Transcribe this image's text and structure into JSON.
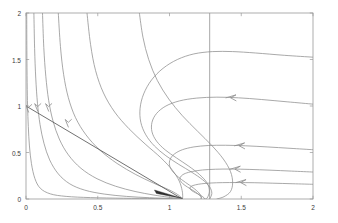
{
  "chart_data": {
    "type": "line",
    "title": "",
    "subtitle": "",
    "xlabel": "",
    "ylabel": "",
    "xlim": [
      0,
      2
    ],
    "ylim": [
      0,
      2
    ],
    "grid": false,
    "legend": "none",
    "xticks": [
      "0",
      "0.5",
      "1",
      "1.5",
      "2"
    ],
    "xtick_values": [
      0,
      0.5,
      1,
      1.5,
      2
    ],
    "yticks": [
      "0",
      "0.5",
      "1",
      "1.5",
      "2"
    ],
    "ytick_values": [
      0,
      0.5,
      1,
      1.5,
      2
    ],
    "equilibrium_point": [
      1.09,
      0.0
    ],
    "colors": {
      "trajectory": "#8c8c8c",
      "nullcline": "#4d4d4d",
      "axis": "#9a9a9a",
      "vertical_line": "#8c8c8c",
      "arrow": "#8c8c8c",
      "background": "#ffffff"
    },
    "vertical_line": {
      "x": 1.28,
      "y_from": 0.0,
      "y_to": 2.0
    },
    "straight_line": {
      "x_from": 0.0,
      "y_from": 1.0,
      "x_to": 1.09,
      "y_to": 0.0
    },
    "series": [
      {
        "name": "trajectory-1",
        "points": [
          [
            0.005,
            2.0
          ],
          [
            0.006,
            1.6
          ],
          [
            0.008,
            1.25
          ],
          [
            0.011,
            1.0
          ],
          [
            0.016,
            0.78
          ],
          [
            0.024,
            0.57
          ],
          [
            0.038,
            0.38
          ],
          [
            0.062,
            0.22
          ],
          [
            0.1,
            0.115
          ],
          [
            0.17,
            0.055
          ],
          [
            0.28,
            0.028
          ],
          [
            0.45,
            0.015
          ],
          [
            0.68,
            0.008
          ],
          [
            0.9,
            0.005
          ],
          [
            1.09,
            0.0
          ]
        ],
        "arrow": {
          "x": 0.018,
          "y": 0.99,
          "dir": "down"
        }
      },
      {
        "name": "trajectory-2",
        "points": [
          [
            0.055,
            2.0
          ],
          [
            0.06,
            1.62
          ],
          [
            0.068,
            1.3
          ],
          [
            0.08,
            1.03
          ],
          [
            0.098,
            0.8
          ],
          [
            0.125,
            0.6
          ],
          [
            0.165,
            0.42
          ],
          [
            0.225,
            0.27
          ],
          [
            0.305,
            0.163
          ],
          [
            0.41,
            0.095
          ],
          [
            0.545,
            0.053
          ],
          [
            0.7,
            0.028
          ],
          [
            0.86,
            0.014
          ],
          [
            1.0,
            0.006
          ],
          [
            1.09,
            0.0
          ]
        ],
        "arrow": {
          "x": 0.082,
          "y": 1.0,
          "dir": "down"
        }
      },
      {
        "name": "trajectory-3",
        "points": [
          [
            0.115,
            2.0
          ],
          [
            0.124,
            1.63
          ],
          [
            0.138,
            1.32
          ],
          [
            0.158,
            1.06
          ],
          [
            0.188,
            0.84
          ],
          [
            0.232,
            0.645
          ],
          [
            0.295,
            0.475
          ],
          [
            0.383,
            0.33
          ],
          [
            0.495,
            0.218
          ],
          [
            0.625,
            0.137
          ],
          [
            0.76,
            0.081
          ],
          [
            0.885,
            0.044
          ],
          [
            0.99,
            0.02
          ],
          [
            1.055,
            0.007
          ],
          [
            1.09,
            0.0
          ]
        ],
        "arrow": {
          "x": 0.158,
          "y": 1.0,
          "dir": "down"
        }
      },
      {
        "name": "trajectory-4",
        "points": [
          [
            0.225,
            2.0
          ],
          [
            0.24,
            1.64
          ],
          [
            0.262,
            1.34
          ],
          [
            0.295,
            1.09
          ],
          [
            0.345,
            0.875
          ],
          [
            0.418,
            0.69
          ],
          [
            0.515,
            0.525
          ],
          [
            0.635,
            0.382
          ],
          [
            0.765,
            0.263
          ],
          [
            0.89,
            0.17
          ],
          [
            0.995,
            0.1
          ],
          [
            1.055,
            0.05
          ],
          [
            1.082,
            0.016
          ],
          [
            1.09,
            0.0
          ]
        ],
        "arrow": {
          "x": 0.295,
          "y": 0.83,
          "dir": "down"
        }
      },
      {
        "name": "trajectory-5",
        "points": [
          [
            0.425,
            2.0
          ],
          [
            0.45,
            1.66
          ],
          [
            0.485,
            1.38
          ],
          [
            0.54,
            1.14
          ],
          [
            0.618,
            0.935
          ],
          [
            0.718,
            0.755
          ],
          [
            0.83,
            0.592
          ],
          [
            0.94,
            0.443
          ],
          [
            1.02,
            0.31
          ],
          [
            1.068,
            0.192
          ],
          [
            1.088,
            0.092
          ],
          [
            1.092,
            0.028
          ],
          [
            1.09,
            0.0
          ]
        ],
        "arrow": null
      },
      {
        "name": "trajectory-6",
        "points": [
          [
            0.79,
            2.0
          ],
          [
            0.815,
            1.74
          ],
          [
            0.855,
            1.5
          ],
          [
            0.915,
            1.275
          ],
          [
            0.995,
            1.075
          ],
          [
            1.09,
            0.895
          ],
          [
            1.195,
            0.73
          ],
          [
            1.295,
            0.575
          ],
          [
            1.375,
            0.43
          ],
          [
            1.425,
            0.295
          ],
          [
            1.44,
            0.175
          ],
          [
            1.425,
            0.08
          ],
          [
            1.38,
            0.025
          ],
          [
            1.33,
            0.0
          ]
        ],
        "arrow": null
      },
      {
        "name": "trajectory-7",
        "points": [
          [
            2.0,
            1.525
          ],
          [
            1.8,
            1.545
          ],
          [
            1.6,
            1.57
          ],
          [
            1.44,
            1.585
          ],
          [
            1.3,
            1.585
          ],
          [
            1.17,
            1.56
          ],
          [
            1.055,
            1.5
          ],
          [
            0.955,
            1.405
          ],
          [
            0.875,
            1.28
          ],
          [
            0.82,
            1.13
          ],
          [
            0.795,
            0.975
          ],
          [
            0.8,
            0.825
          ],
          [
            0.835,
            0.69
          ],
          [
            0.895,
            0.57
          ],
          [
            0.975,
            0.465
          ],
          [
            1.065,
            0.372
          ],
          [
            1.155,
            0.288
          ],
          [
            1.23,
            0.208
          ],
          [
            1.28,
            0.13
          ],
          [
            1.295,
            0.06
          ],
          [
            1.28,
            0.0
          ]
        ],
        "arrow": null
      },
      {
        "name": "trajectory-8",
        "points": [
          [
            2.0,
            1.02
          ],
          [
            1.82,
            1.045
          ],
          [
            1.64,
            1.07
          ],
          [
            1.48,
            1.088
          ],
          [
            1.33,
            1.095
          ],
          [
            1.19,
            1.085
          ],
          [
            1.07,
            1.055
          ],
          [
            0.975,
            1.0
          ],
          [
            0.91,
            0.92
          ],
          [
            0.878,
            0.825
          ],
          [
            0.878,
            0.722
          ],
          [
            0.91,
            0.622
          ],
          [
            0.97,
            0.528
          ],
          [
            1.05,
            0.44
          ],
          [
            1.135,
            0.352
          ],
          [
            1.21,
            0.262
          ],
          [
            1.262,
            0.172
          ],
          [
            1.278,
            0.085
          ],
          [
            1.262,
            0.01
          ],
          [
            1.24,
            0.0
          ]
        ],
        "arrow": {
          "x": 1.43,
          "y": 1.088,
          "dir": "left"
        }
      },
      {
        "name": "trajectory-9",
        "points": [
          [
            2.0,
            0.53
          ],
          [
            1.84,
            0.545
          ],
          [
            1.68,
            0.56
          ],
          [
            1.53,
            0.572
          ],
          [
            1.39,
            0.578
          ],
          [
            1.27,
            0.575
          ],
          [
            1.17,
            0.56
          ],
          [
            1.09,
            0.53
          ],
          [
            1.035,
            0.485
          ],
          [
            1.005,
            0.428
          ],
          [
            1.0,
            0.365
          ],
          [
            1.02,
            0.3
          ],
          [
            1.06,
            0.238
          ],
          [
            1.112,
            0.178
          ],
          [
            1.165,
            0.12
          ],
          [
            1.205,
            0.066
          ],
          [
            1.222,
            0.022
          ],
          [
            1.218,
            0.0
          ]
        ],
        "arrow": {
          "x": 1.49,
          "y": 0.572,
          "dir": "left"
        }
      },
      {
        "name": "trajectory-10",
        "points": [
          [
            2.0,
            0.29
          ],
          [
            1.85,
            0.3
          ],
          [
            1.7,
            0.31
          ],
          [
            1.56,
            0.318
          ],
          [
            1.43,
            0.322
          ],
          [
            1.32,
            0.32
          ],
          [
            1.23,
            0.312
          ],
          [
            1.16,
            0.296
          ],
          [
            1.11,
            0.275
          ],
          [
            1.082,
            0.248
          ],
          [
            1.072,
            0.216
          ],
          [
            1.082,
            0.182
          ],
          [
            1.108,
            0.146
          ],
          [
            1.145,
            0.11
          ],
          [
            1.182,
            0.074
          ],
          [
            1.21,
            0.04
          ],
          [
            1.222,
            0.012
          ],
          [
            1.218,
            0.0
          ]
        ],
        "arrow": {
          "x": 1.46,
          "y": 0.321,
          "dir": "left"
        }
      },
      {
        "name": "trajectory-11",
        "points": [
          [
            2.0,
            0.158
          ],
          [
            1.86,
            0.164
          ],
          [
            1.72,
            0.17
          ],
          [
            1.59,
            0.175
          ],
          [
            1.47,
            0.177
          ],
          [
            1.37,
            0.176
          ],
          [
            1.29,
            0.172
          ],
          [
            1.225,
            0.164
          ],
          [
            1.18,
            0.152
          ],
          [
            1.152,
            0.137
          ],
          [
            1.142,
            0.119
          ],
          [
            1.148,
            0.099
          ],
          [
            1.168,
            0.078
          ],
          [
            1.195,
            0.056
          ],
          [
            1.222,
            0.034
          ],
          [
            1.24,
            0.014
          ],
          [
            1.244,
            0.0
          ]
        ],
        "arrow": {
          "x": 1.5,
          "y": 0.177,
          "dir": "left"
        }
      }
    ]
  },
  "axes": {
    "x_tick_labels": [
      "0",
      "0.5",
      "1",
      "1.5",
      "2"
    ],
    "y_tick_labels": [
      "0",
      "0.5",
      "1",
      "1.5",
      "2"
    ]
  }
}
